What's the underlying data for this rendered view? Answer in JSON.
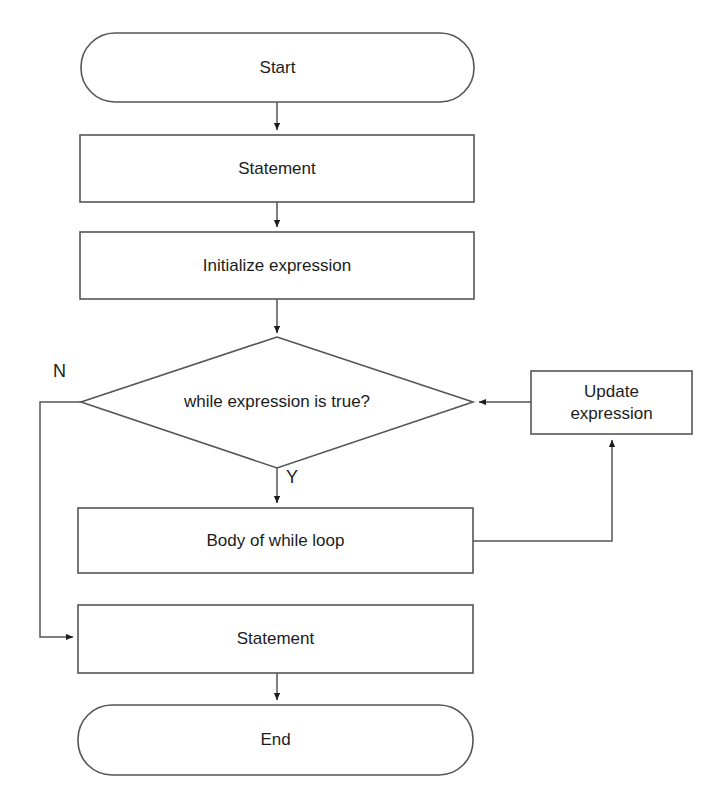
{
  "diagram": {
    "type": "flowchart",
    "background_color": "#ffffff",
    "stroke_color": "#555555",
    "text_color": "#1c1c1c",
    "nodes": [
      {
        "id": "start",
        "label": "Start",
        "shape": "terminator",
        "x": 81,
        "y": 33,
        "w": 393,
        "h": 69
      },
      {
        "id": "statement-top",
        "label": "Statement",
        "shape": "process",
        "x": 80,
        "y": 135,
        "w": 394,
        "h": 67
      },
      {
        "id": "initialize-expression",
        "label": "Initialize expression",
        "shape": "process",
        "x": 80,
        "y": 232,
        "w": 394,
        "h": 67
      },
      {
        "id": "while-condition",
        "label": "while expression is true?",
        "shape": "decision",
        "x": 81,
        "y": 337,
        "w": 392,
        "h": 131
      },
      {
        "id": "update-expression",
        "label": "Update\nexpression",
        "shape": "process",
        "x": 531,
        "y": 371,
        "w": 161,
        "h": 63
      },
      {
        "id": "body-of-while-loop",
        "label": "Body of while loop",
        "shape": "process",
        "x": 78,
        "y": 508,
        "w": 395,
        "h": 65
      },
      {
        "id": "statement-bottom",
        "label": "Statement",
        "shape": "process",
        "x": 78,
        "y": 605,
        "w": 395,
        "h": 68
      },
      {
        "id": "end",
        "label": "End",
        "shape": "terminator",
        "x": 78,
        "y": 705,
        "w": 395,
        "h": 70
      }
    ],
    "edge_labels": [
      {
        "id": "no-branch-label",
        "text": "N",
        "x": 53,
        "y": 362
      },
      {
        "id": "yes-branch-label",
        "text": "Y",
        "x": 286,
        "y": 468
      }
    ],
    "edges": [
      {
        "id": "start-to-statement",
        "from": "start",
        "to": "statement-top",
        "arrow": true
      },
      {
        "id": "statement-to-initialize",
        "from": "statement-top",
        "to": "initialize-expression",
        "arrow": true
      },
      {
        "id": "initialize-to-condition",
        "from": "initialize-expression",
        "to": "while-condition",
        "arrow": true
      },
      {
        "id": "condition-yes-to-body",
        "from": "while-condition",
        "to": "body-of-while-loop",
        "arrow": true,
        "label": "Y"
      },
      {
        "id": "condition-no-to-statement",
        "from": "while-condition",
        "to": "statement-bottom",
        "arrow": true,
        "label": "N"
      },
      {
        "id": "body-to-update",
        "from": "body-of-while-loop",
        "to": "update-expression",
        "arrow": true
      },
      {
        "id": "update-to-condition",
        "from": "update-expression",
        "to": "while-condition",
        "arrow": true
      },
      {
        "id": "statement-to-end",
        "from": "statement-bottom",
        "to": "end",
        "arrow": true
      }
    ]
  }
}
